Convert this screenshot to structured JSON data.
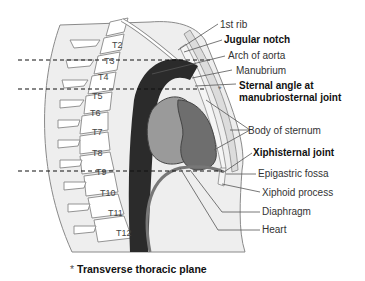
{
  "figure": {
    "vertebrae": [
      "T2",
      "T3",
      "T4",
      "T5",
      "T6",
      "T7",
      "T8",
      "T9",
      "T10",
      "T11",
      "T12"
    ],
    "labels": {
      "first_rib": "1st rib",
      "jugular_notch": "Jugular notch",
      "arch_of_aorta": "Arch of aorta",
      "manubrium": "Manubrium",
      "sternal_angle_line1": "Sternal angle at",
      "sternal_angle_line2": "manubriosternal joint",
      "body_of_sternum": "Body of sternum",
      "xiphisternal_joint": "Xiphisternal joint",
      "epigastric_fossa": "Epigastric fossa",
      "xiphoid_process": "Xiphoid process",
      "diaphragm": "Diaphragm",
      "heart": "Heart"
    },
    "asterisk": "*",
    "footnote": "Transverse thoracic plane",
    "colors": {
      "body_fill": "#eeeeee",
      "aorta": "#2b2b2b",
      "heart_light": "#9a9a9a",
      "heart_dark": "#6e6e6e",
      "bone": "#ffffff",
      "outline": "#777777"
    }
  }
}
